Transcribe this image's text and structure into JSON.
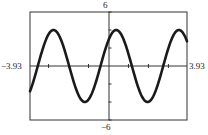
{
  "chart_data": {
    "type": "line",
    "title": "",
    "xlabel": "",
    "ylabel": "",
    "xlim": [
      -3.93,
      3.93
    ],
    "ylim": [
      -6,
      6
    ],
    "window_labels": {
      "xmin": "−3.93",
      "xmax": "3.93",
      "ymin": "−6",
      "ymax": "6"
    },
    "grid": false,
    "axes_visible": true,
    "x_tick_step": 1,
    "y_tick_step": 2,
    "legend": [],
    "annotations": [],
    "estimation_note": "Curve parameters estimated from pixel positions, not from a stated formula. Amplitude ~4, period ~pi, upward zero crossing near x ~ -0.4.",
    "series": [
      {
        "name": "curve",
        "color": "#1a1a1a",
        "estimated_amplitude": 4,
        "estimated_period": 3.14,
        "estimated_upward_zero_crossing": -0.4,
        "x": [
          -3.93,
          -3.5,
          -3.0,
          -2.5,
          -2.0,
          -1.5,
          -1.0,
          -0.5,
          0.0,
          0.5,
          1.0,
          1.5,
          2.0,
          2.5,
          3.0,
          3.5,
          3.93
        ],
        "y": [
          -2.8,
          0.6,
          3.6,
          3.6,
          0.2,
          -3.4,
          -3.8,
          -0.8,
          2.9,
          4.0,
          1.4,
          -2.5,
          -4.0,
          -2.0,
          1.5,
          3.9,
          2.6
        ]
      }
    ]
  }
}
